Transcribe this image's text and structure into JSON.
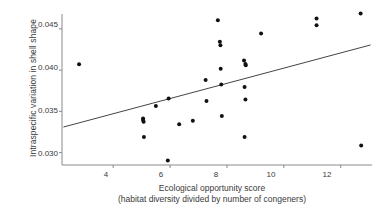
{
  "chart_data": {
    "type": "scatter",
    "title": "",
    "xlabel": "Ecological opportunity score",
    "xlabel_line2": "(habitat diversity divided by number of congeners)",
    "ylabel": "Intraspecific variation in shell shape",
    "xlim": [
      2.2,
      13.1
    ],
    "ylim": [
      0.0285,
      0.0468
    ],
    "xticks": [
      4,
      6,
      8,
      10,
      12
    ],
    "xtick_labels": [
      "4",
      "6",
      "8",
      "10",
      "12"
    ],
    "yticks": [
      0.03,
      0.035,
      0.04,
      0.045
    ],
    "ytick_labels": [
      "0.030",
      "0.035",
      "0.040",
      "0.045"
    ],
    "grid": false,
    "legend": "none",
    "point_color": "#111111",
    "line_color": "#444444",
    "axis_color": "#888888",
    "points": [
      {
        "x": 2.8,
        "y": 0.0407
      },
      {
        "x": 5.05,
        "y": 0.03415
      },
      {
        "x": 5.05,
        "y": 0.03395
      },
      {
        "x": 5.07,
        "y": 0.03375
      },
      {
        "x": 5.08,
        "y": 0.0319
      },
      {
        "x": 5.5,
        "y": 0.03565
      },
      {
        "x": 5.92,
        "y": 0.02905
      },
      {
        "x": 5.95,
        "y": 0.03655
      },
      {
        "x": 6.32,
        "y": 0.03345
      },
      {
        "x": 6.8,
        "y": 0.03385
      },
      {
        "x": 7.25,
        "y": 0.0388
      },
      {
        "x": 7.28,
        "y": 0.03625
      },
      {
        "x": 7.68,
        "y": 0.04605
      },
      {
        "x": 7.75,
        "y": 0.04345
      },
      {
        "x": 7.77,
        "y": 0.043
      },
      {
        "x": 7.78,
        "y": 0.04015
      },
      {
        "x": 7.8,
        "y": 0.03825
      },
      {
        "x": 7.82,
        "y": 0.03445
      },
      {
        "x": 8.6,
        "y": 0.04115
      },
      {
        "x": 8.65,
        "y": 0.04075
      },
      {
        "x": 8.66,
        "y": 0.0406
      },
      {
        "x": 8.62,
        "y": 0.03795
      },
      {
        "x": 8.65,
        "y": 0.03645
      },
      {
        "x": 8.62,
        "y": 0.0319
      },
      {
        "x": 9.2,
        "y": 0.04445
      },
      {
        "x": 11.15,
        "y": 0.04625
      },
      {
        "x": 11.15,
        "y": 0.04545
      },
      {
        "x": 12.7,
        "y": 0.04685
      },
      {
        "x": 12.72,
        "y": 0.03085
      }
    ],
    "trendline": {
      "x_start": 2.25,
      "y_start": 0.0331,
      "x_end": 13.05,
      "y_end": 0.04305
    }
  }
}
